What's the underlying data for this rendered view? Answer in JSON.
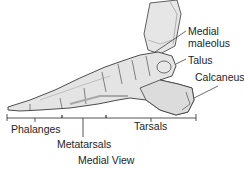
{
  "diagram": {
    "title": "Medial View",
    "labels": {
      "medial_line1": "Medial",
      "medial_line2": "maleolus",
      "talus": "Talus",
      "calcaneus": "Calcaneus"
    },
    "regions": {
      "phalanges": "Phalanges",
      "metatarsals": "Metatarsals",
      "tarsals": "Tarsals"
    },
    "colors": {
      "bone_fill": "#e4e4e4",
      "bone_shade": "#bdbdbd",
      "outline": "#3a3a3a",
      "text": "#1e1e1e"
    }
  }
}
